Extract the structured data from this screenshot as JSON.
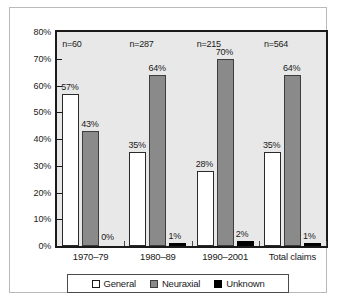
{
  "chart_data": {
    "type": "bar",
    "title": "",
    "xlabel": "",
    "ylabel": "",
    "ylim": [
      0,
      80
    ],
    "ytick_labels": [
      "0%",
      "10%",
      "20%",
      "30%",
      "40%",
      "50%",
      "60%",
      "70%",
      "80%"
    ],
    "ytick_values": [
      0,
      10,
      20,
      30,
      40,
      50,
      60,
      70,
      80
    ],
    "grid": false,
    "legend_position": "bottom",
    "categories": [
      "1970–79",
      "1980–89",
      "1990–2001",
      "Total claims"
    ],
    "group_annotations": [
      "n=60",
      "n=287",
      "n=215",
      "n=564"
    ],
    "series": [
      {
        "name": "General",
        "color": "#ffffff",
        "values": [
          57,
          35,
          28,
          35
        ],
        "labels": [
          "57%",
          "35%",
          "28%",
          "35%"
        ]
      },
      {
        "name": "Neuraxial",
        "color": "#8a8a8a",
        "values": [
          43,
          64,
          70,
          64
        ],
        "labels": [
          "43%",
          "64%",
          "70%",
          "64%"
        ]
      },
      {
        "name": "Unknown",
        "color": "#000000",
        "values": [
          0,
          1,
          2,
          1
        ],
        "labels": [
          "0%",
          "1%",
          "2%",
          "1%"
        ]
      }
    ]
  },
  "legend": {
    "items": [
      {
        "label": "General",
        "swatch": "general"
      },
      {
        "label": "Neuraxial",
        "swatch": "neuraxial"
      },
      {
        "label": "Unknown",
        "swatch": "unknown"
      }
    ]
  }
}
